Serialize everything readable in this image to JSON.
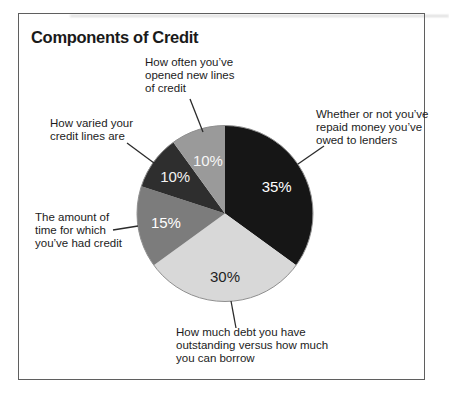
{
  "figure": {
    "title": "Components of Credit"
  },
  "chart_data": {
    "type": "pie",
    "title": "Components of Credit",
    "start_angle_deg": 0,
    "direction": "clockwise",
    "legend_position": "callout-labels",
    "outline_color": "#8f8f8f",
    "slices": [
      {
        "label": "Whether or not you’ve repaid money you’ve owed to lenders",
        "value": 35,
        "pct_label": "35%",
        "color": "#161616",
        "pct_label_color": "#ffffff"
      },
      {
        "label": "How much debt you have outstanding versus how much you can borrow",
        "value": 30,
        "pct_label": "30%",
        "color": "#d8d8d8",
        "pct_label_color": "#1f1f1f"
      },
      {
        "label": "The amount of time for which you’ve had credit",
        "value": 15,
        "pct_label": "15%",
        "color": "#7c7c7c",
        "pct_label_color": "#ffffff"
      },
      {
        "label": "How varied your credit lines are",
        "value": 10,
        "pct_label": "10%",
        "color": "#2e2e2e",
        "pct_label_color": "#f2f2f2"
      },
      {
        "label": "How often you’ve opened new lines of credit",
        "value": 10,
        "pct_label": "10%",
        "color": "#9a9a9a",
        "pct_label_color": "#f6f6f6"
      }
    ]
  },
  "callouts": {
    "new_lines": {
      "lines": [
        "How often you’ve",
        "opened new lines",
        "of credit"
      ]
    },
    "varied": {
      "lines": [
        "How varied your",
        "credit lines are"
      ]
    },
    "time": {
      "lines": [
        "The amount of",
        "time for which",
        "you’ve had credit"
      ]
    },
    "repaid": {
      "lines": [
        "Whether or not you’ve",
        "repaid money you’ve",
        "owed to lenders"
      ]
    },
    "debt": {
      "lines": [
        "How much debt you have",
        "outstanding versus how much",
        "you can borrow"
      ]
    }
  }
}
